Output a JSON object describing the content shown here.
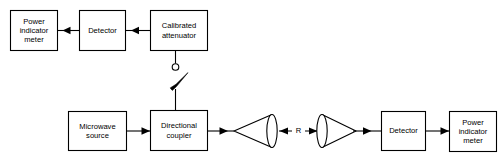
{
  "diagram": {
    "colors": {
      "background": "#ffffff",
      "stroke": "#000000",
      "box_fill": "#ffffff"
    },
    "top_chain": {
      "blocks": [
        {
          "id": "power-indicator-meter-top",
          "lines": [
            "Power",
            "indicator",
            "meter"
          ]
        },
        {
          "id": "detector-top",
          "lines": [
            "Detector"
          ]
        },
        {
          "id": "calibrated-attenuator",
          "lines": [
            "Calibrated",
            "attenuator"
          ]
        }
      ]
    },
    "bottom_chain": {
      "blocks": [
        {
          "id": "microwave-source",
          "lines": [
            "Microwave",
            "source"
          ]
        },
        {
          "id": "directional-coupler",
          "lines": [
            "Directional",
            "coupler"
          ]
        },
        {
          "id": "detector-bottom",
          "lines": [
            "Detector"
          ]
        },
        {
          "id": "power-indicator-meter-bottom",
          "lines": [
            "Power",
            "indicator",
            "meter"
          ]
        }
      ]
    },
    "antennas": [
      {
        "id": "transmit-horn-antenna",
        "orientation": "apex-left"
      },
      {
        "id": "receive-horn-antenna",
        "orientation": "apex-right"
      }
    ],
    "dimension": {
      "label": "R",
      "style": "double-headed-arrow"
    },
    "switch": {
      "id": "coupler-attenuator-switch",
      "terminal": "open-circle",
      "blade": "tapered-open-blade"
    }
  }
}
